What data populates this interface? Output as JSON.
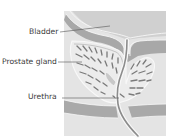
{
  "diagram": {
    "labels": {
      "bladder": "Bladder",
      "prostate": "Prostate gland",
      "urethra": "Urethra"
    },
    "colors": {
      "background": "#ffffff",
      "tissue_light": "#e4e4e4",
      "bladder_fill": "#d2d2d2",
      "muscle_band": "#a9a9a9",
      "gland_fill": "#ececec",
      "lobule_stroke": "#7a7a7a",
      "outline": "#f8f8f8",
      "leader_line": "#555555",
      "text": "#3a3a3a"
    }
  }
}
